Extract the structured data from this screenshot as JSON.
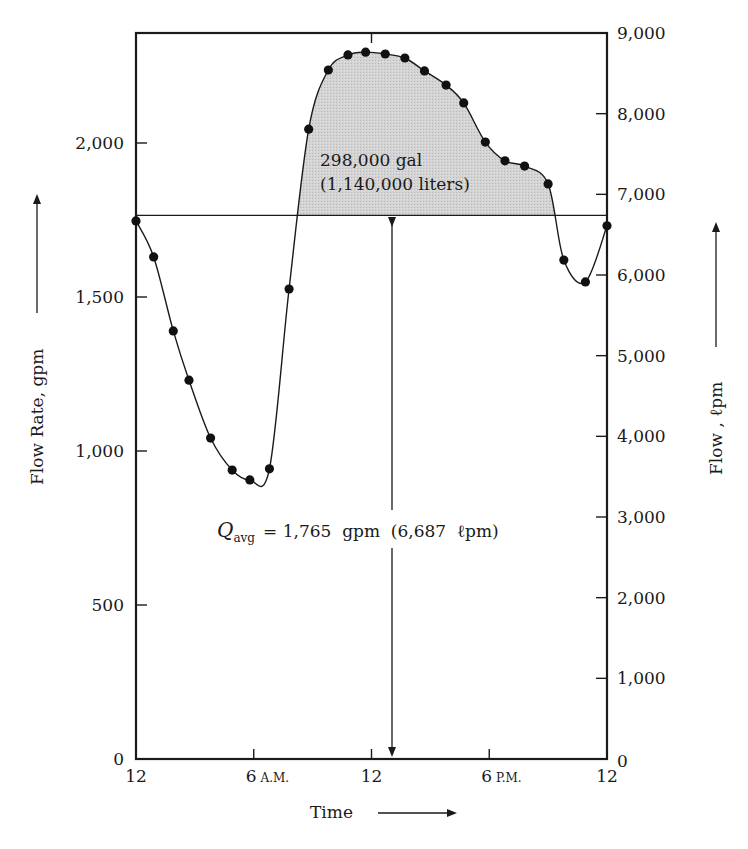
{
  "chart_data": {
    "type": "line",
    "title": "",
    "xlabel": "Time",
    "ylabel": "Flow Rate, gpm",
    "y2label": "Flow , ℓpm",
    "x_ticks": [
      {
        "hour": 0,
        "label": "12",
        "suffix": ""
      },
      {
        "hour": 6,
        "label": "6",
        "suffix": "A.M."
      },
      {
        "hour": 12,
        "label": "12",
        "suffix": ""
      },
      {
        "hour": 18,
        "label": "6",
        "suffix": "P.M."
      },
      {
        "hour": 24,
        "label": "12",
        "suffix": ""
      }
    ],
    "xlim": [
      0,
      24
    ],
    "ylim": [
      0,
      2380
    ],
    "y_ticks": [
      {
        "value": 0,
        "label": "0"
      },
      {
        "value": 500,
        "label": "500"
      },
      {
        "value": 1000,
        "label": "1,000"
      },
      {
        "value": 1500,
        "label": "1,500"
      },
      {
        "value": 2000,
        "label": "2,000"
      }
    ],
    "y2lim": [
      0,
      9000
    ],
    "y2_ticks": [
      {
        "value": 0,
        "label": "0"
      },
      {
        "value": 1000,
        "label": "1,000"
      },
      {
        "value": 2000,
        "label": "2,000"
      },
      {
        "value": 3000,
        "label": "3,000"
      },
      {
        "value": 4000,
        "label": "4,000"
      },
      {
        "value": 5000,
        "label": "5,000"
      },
      {
        "value": 6000,
        "label": "6,000"
      },
      {
        "value": 7000,
        "label": "7,000"
      },
      {
        "value": 8000,
        "label": "8,000"
      },
      {
        "value": 9000,
        "label": "9,000"
      }
    ],
    "grid": false,
    "series": [
      {
        "name": "Flow rate (gpm)",
        "x": [
          0,
          0.9,
          1.9,
          2.7,
          3.8,
          4.9,
          5.8,
          6.8,
          7.8,
          8.8,
          9.8,
          10.8,
          11.7,
          12.7,
          13.7,
          14.7,
          15.8,
          16.7,
          17.8,
          18.8,
          19.8,
          21.0,
          21.8,
          22.9,
          24.0
        ],
        "values": [
          1747,
          1630,
          1390,
          1230,
          1042,
          938,
          906,
          942,
          1526,
          2045,
          2237,
          2286,
          2295,
          2289,
          2276,
          2234,
          2188,
          2130,
          2003,
          1942,
          1925,
          1867,
          1620,
          1549,
          1731
        ]
      }
    ],
    "average_line": {
      "value": 1765,
      "label": "Q_avg = 1,765 gpm (6,687 ℓpm)"
    },
    "shaded_area": {
      "label_line1": "298,000 gal",
      "label_line2": "(1,140,000 liters)",
      "color": "#cfcfcf"
    }
  },
  "labels": {
    "left_axis": "Flow Rate, gpm",
    "right_axis": "Flow , ℓpm",
    "x_axis": "Time",
    "avg_q": "Q",
    "avg_sub": "avg",
    "avg_rest": "= 1,765  gpm  (6,687  ℓpm)",
    "area_line1": "298,000 gal",
    "area_line2": "(1,140,000 liters)"
  },
  "colors": {
    "line": "#1a1a1a",
    "shade": "#cfcfcf",
    "axis": "#1a1a1a"
  }
}
